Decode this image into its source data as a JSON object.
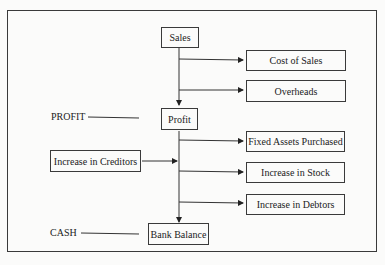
{
  "diagram": {
    "nodes": {
      "sales": "Sales",
      "cost_of_sales": "Cost of Sales",
      "overheads": "Overheads",
      "profit": "Profit",
      "fixed_assets": "Fixed Assets Purchased",
      "increase_creditors": "Increase in Creditors",
      "increase_stock": "Increase in Stock",
      "increase_debtors": "Increase in Debtors",
      "bank_balance": "Bank Balance"
    },
    "side_labels": {
      "profit": "PROFIT",
      "cash": "CASH"
    }
  }
}
